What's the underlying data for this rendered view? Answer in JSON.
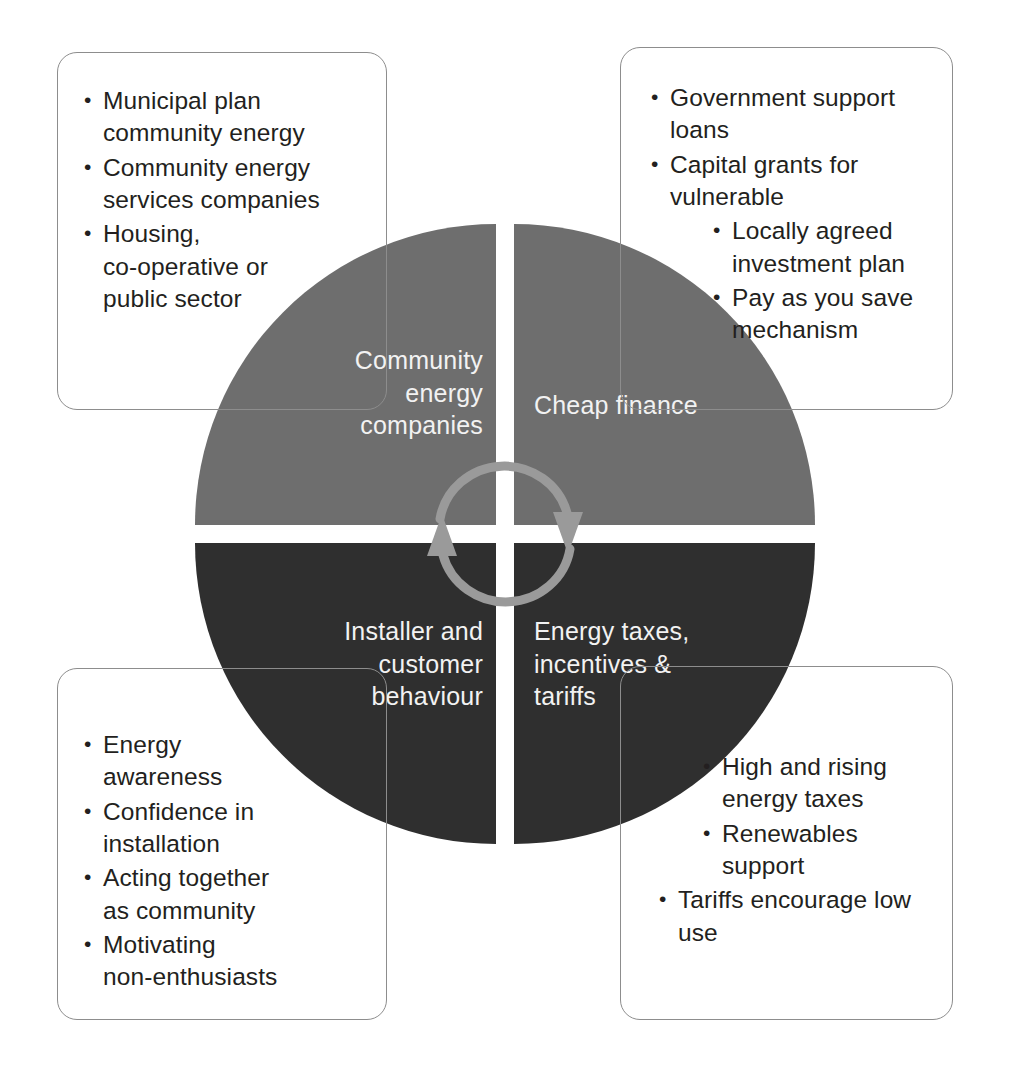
{
  "diagram": {
    "colors": {
      "quadrant_top": "#6e6e6e",
      "quadrant_bottom": "#2f2f2f",
      "quadrant_label_text": "#f2f2f2",
      "arrow": "#9a9a9a",
      "box_border": "#8d8d8d",
      "body_text": "#231f20",
      "background": "#ffffff"
    },
    "quadrants": [
      {
        "position": "top-left",
        "label": "Community\nenergy\ncompanies",
        "fill": "#6e6e6e"
      },
      {
        "position": "top-right",
        "label": "Cheap finance",
        "fill": "#6e6e6e"
      },
      {
        "position": "bottom-left",
        "label": "Installer and\ncustomer\nbehaviour",
        "fill": "#2f2f2f"
      },
      {
        "position": "bottom-right",
        "label": "Energy taxes,\nincentives &\ntariffs",
        "fill": "#2f2f2f"
      }
    ],
    "cycle_arrows": [
      {
        "name": "top-arc-arrow",
        "direction": "clockwise"
      },
      {
        "name": "bottom-arc-arrow",
        "direction": "clockwise"
      }
    ],
    "callouts": {
      "top_left": {
        "name": "community-energy-companies-callout",
        "bullets": [
          {
            "text": "Municipal plan\ncommunity energy",
            "indent": 0
          },
          {
            "text": "Community energy\nservices companies",
            "indent": 0
          },
          {
            "text": "Housing,\nco-operative or\npublic sector",
            "indent": 0
          }
        ]
      },
      "top_right": {
        "name": "cheap-finance-callout",
        "bullets": [
          {
            "text": "Government support\nloans",
            "indent": 0
          },
          {
            "text": "Capital grants for\nvulnerable",
            "indent": 0
          },
          {
            "text": "Locally agreed\ninvestment plan",
            "indent": 2
          },
          {
            "text": "Pay as you save\nmechanism",
            "indent": 2
          }
        ]
      },
      "bottom_left": {
        "name": "installer-customer-behaviour-callout",
        "bullets": [
          {
            "text": "Energy\nawareness",
            "indent": 0
          },
          {
            "text": "Confidence in\ninstallation",
            "indent": 0
          },
          {
            "text": "Acting together\nas community",
            "indent": 0
          },
          {
            "text": "Motivating\nnon-enthusiasts",
            "indent": 0
          }
        ]
      },
      "bottom_right": {
        "name": "energy-taxes-incentives-tariffs-callout",
        "bullets": [
          {
            "text": "High and rising\nenergy taxes",
            "indent": 2
          },
          {
            "text": "Renewables\nsupport",
            "indent": 2
          },
          {
            "text": "Tariffs encourage low\nuse",
            "indent": 1
          }
        ]
      }
    }
  }
}
